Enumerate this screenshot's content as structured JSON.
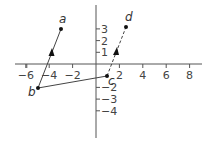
{
  "diagram": {
    "type": "coordinate-plane-vectors",
    "colors": {
      "axis": "#555555",
      "line": "#444444",
      "point": "#111111",
      "text": "#444444"
    },
    "x_axis": {
      "range": [
        -7,
        9
      ],
      "tick_labels": [
        "−6",
        "−4",
        "−2",
        "2",
        "4",
        "6",
        "8"
      ],
      "tick_values": [
        -6,
        -4,
        -2,
        2,
        4,
        6,
        8
      ]
    },
    "y_axis": {
      "range": [
        -5,
        5
      ],
      "tick_labels": [
        "3",
        "2",
        "1",
        "−2",
        "−3",
        "−4"
      ],
      "tick_values": [
        3,
        2,
        1,
        -2,
        -3,
        -4
      ]
    },
    "points": [
      {
        "label": "a",
        "x": -3,
        "y": 3
      },
      {
        "label": "b",
        "x": -5,
        "y": -2
      },
      {
        "label": "c",
        "x": 1,
        "y": -1
      },
      {
        "label": "d",
        "x": 2.6,
        "y": 3.2
      }
    ],
    "segments": [
      {
        "from": "b",
        "to": "a",
        "style": "solid",
        "arrow": "toward a"
      },
      {
        "from": "b",
        "to": "c",
        "style": "solid",
        "arrow": "none"
      },
      {
        "from": "c",
        "to": "d",
        "style": "dashed",
        "arrow": "toward d"
      }
    ]
  }
}
